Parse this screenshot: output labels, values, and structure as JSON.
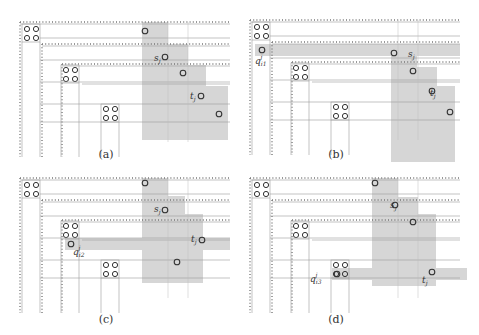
{
  "figure": {
    "panels": [
      {
        "id": "a",
        "caption": "(a)",
        "origin": [
          20,
          22
        ],
        "caption_pos": [
          106,
          148
        ],
        "labels": [
          {
            "text": "s",
            "sub": "j",
            "sup": "",
            "x": 134,
            "y": 39
          },
          {
            "text": "t",
            "sub": "j",
            "sup": "",
            "x": 170,
            "y": 77
          }
        ],
        "gray_rows": [],
        "gray_staircase": [
          {
            "x": 122,
            "y": 0,
            "w": 26,
            "h": 118
          },
          {
            "x": 148,
            "y": 22,
            "w": 20,
            "h": 96
          },
          {
            "x": 168,
            "y": 43,
            "w": 18,
            "h": 75
          },
          {
            "x": 186,
            "y": 64,
            "w": 22,
            "h": 54
          }
        ],
        "points": [
          [
            125,
            9
          ],
          [
            145,
            35
          ],
          [
            163,
            51
          ],
          [
            181,
            74
          ],
          [
            199,
            92
          ]
        ]
      },
      {
        "id": "b",
        "caption": "(b)",
        "origin": [
          250,
          20
        ],
        "caption_pos": [
          336,
          148
        ],
        "labels": [
          {
            "text": "s",
            "sub": "j",
            "sup": "",
            "x": 158,
            "y": 37
          },
          {
            "text": "t",
            "sub": "j",
            "sup": "",
            "x": 180,
            "y": 76
          },
          {
            "text": "q",
            "sub": "i1",
            "sup": "j",
            "x": 5,
            "y": 44
          }
        ],
        "gray_rows": [
          {
            "x": 5,
            "y": 24,
            "w": 205,
            "h": 12
          }
        ],
        "gray_staircase": [
          {
            "x": 141,
            "y": 24,
            "w": 26,
            "h": 118
          },
          {
            "x": 167,
            "y": 47,
            "w": 20,
            "h": 95
          },
          {
            "x": 187,
            "y": 66,
            "w": 18,
            "h": 76
          }
        ],
        "points": [
          [
            12,
            30
          ],
          [
            144,
            33
          ],
          [
            163,
            51
          ],
          [
            182,
            71
          ],
          [
            200,
            92
          ]
        ]
      },
      {
        "id": "c",
        "caption": "(c)",
        "origin": [
          20,
          178
        ],
        "caption_pos": [
          106,
          313
        ],
        "labels": [
          {
            "text": "s",
            "sub": "j",
            "sup": "",
            "x": 134,
            "y": 34
          },
          {
            "text": "t",
            "sub": "j",
            "sup": "",
            "x": 171,
            "y": 64
          },
          {
            "text": "q",
            "sub": "i2",
            "sup": "j",
            "x": 53,
            "y": 77
          }
        ],
        "gray_rows": [
          {
            "x": 45,
            "y": 60,
            "w": 165,
            "h": 12
          }
        ],
        "gray_staircase": [
          {
            "x": 122,
            "y": 0,
            "w": 26,
            "h": 105
          },
          {
            "x": 148,
            "y": 18,
            "w": 17,
            "h": 87
          },
          {
            "x": 165,
            "y": 36,
            "w": 18,
            "h": 69
          }
        ],
        "points": [
          [
            125,
            5
          ],
          [
            145,
            32
          ],
          [
            51,
            66
          ],
          [
            182,
            62
          ],
          [
            157,
            84
          ]
        ]
      },
      {
        "id": "d",
        "caption": "(d)",
        "origin": [
          250,
          178
        ],
        "caption_pos": [
          336,
          313
        ],
        "labels": [
          {
            "text": "s",
            "sub": "j",
            "sup": "",
            "x": 140,
            "y": 30
          },
          {
            "text": "t",
            "sub": "j",
            "sup": "",
            "x": 172,
            "y": 105
          },
          {
            "text": "q",
            "sub": "i3",
            "sup": "j",
            "x": 60,
            "y": 104
          }
        ],
        "gray_rows": [
          {
            "x": 82,
            "y": 90,
            "w": 135,
            "h": 12
          }
        ],
        "gray_staircase": [
          {
            "x": 122,
            "y": 0,
            "w": 26,
            "h": 108
          },
          {
            "x": 148,
            "y": 19,
            "w": 20,
            "h": 89
          },
          {
            "x": 168,
            "y": 36,
            "w": 18,
            "h": 72
          }
        ],
        "points": [
          [
            125,
            5
          ],
          [
            145,
            27
          ],
          [
            163,
            44
          ],
          [
            87,
            96
          ],
          [
            182,
            94
          ]
        ]
      }
    ],
    "colors": {
      "gray_fill": "#d6d6d6",
      "line": "#9a9a9a",
      "dot": "#777777",
      "circle_stroke": "#333333",
      "text": "#333333"
    }
  }
}
